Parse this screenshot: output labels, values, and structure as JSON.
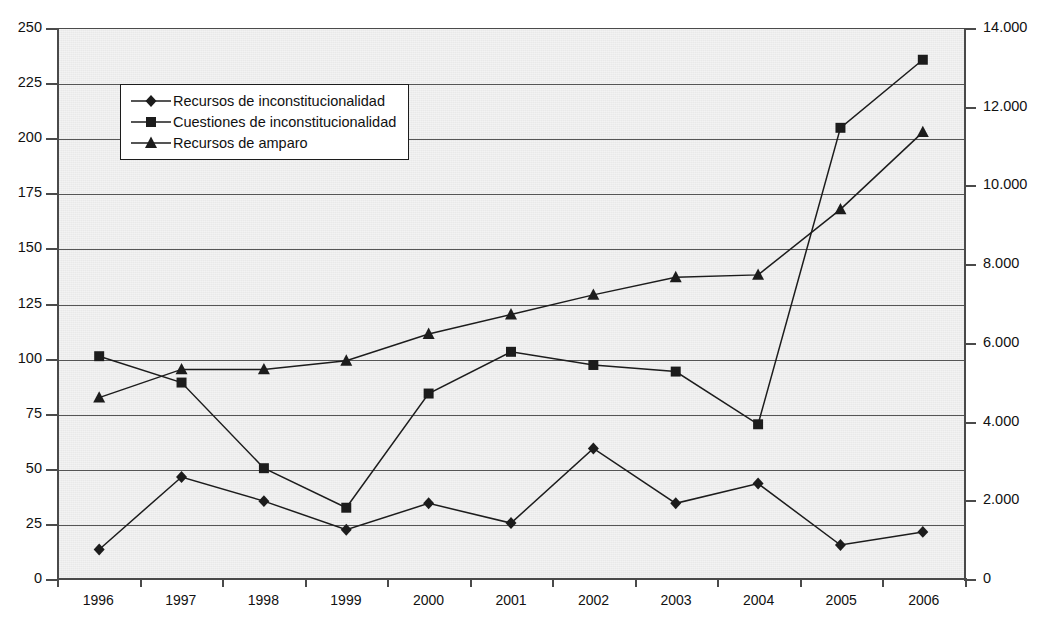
{
  "chart_title": "",
  "chart_data": {
    "type": "line",
    "title": "",
    "xlabel": "",
    "ylabel": "",
    "grid": true,
    "legend_position": "upper-left-inside",
    "categories": [
      "1996",
      "1997",
      "1998",
      "1999",
      "2000",
      "2001",
      "2002",
      "2003",
      "2004",
      "2005",
      "2006"
    ],
    "axes": {
      "left": {
        "label": "",
        "ylim": [
          0,
          250
        ],
        "tick_step": 25,
        "ticks": [
          "0",
          "25",
          "50",
          "75",
          "100",
          "125",
          "150",
          "175",
          "200",
          "225",
          "250"
        ]
      },
      "right": {
        "label": "",
        "ylim": [
          0,
          14000
        ],
        "tick_step": 2000,
        "ticks": [
          "0",
          "2.000",
          "4.000",
          "6.000",
          "8.000",
          "10.000",
          "12.000",
          "14.000"
        ]
      }
    },
    "series": [
      {
        "name": "Recursos de inconstitucionalidad",
        "axis": "left",
        "marker": "diamond",
        "values": [
          13,
          46,
          35,
          22,
          34,
          25,
          59,
          34,
          43,
          15,
          21
        ]
      },
      {
        "name": "Cuestiones de inconstitucionalidad",
        "axis": "left",
        "marker": "square",
        "values": [
          101,
          89,
          50,
          32,
          84,
          103,
          97,
          94,
          70,
          205,
          236
        ]
      },
      {
        "name": "Recursos de amparo",
        "axis": "right",
        "marker": "triangle",
        "values": [
          4600,
          5320,
          5320,
          5540,
          6220,
          6720,
          7220,
          7670,
          7730,
          9400,
          11370
        ]
      }
    ]
  },
  "legend": {
    "items": [
      {
        "label": "Recursos de inconstitucionalidad",
        "marker": "diamond"
      },
      {
        "label": "Cuestiones de inconstitucionalidad",
        "marker": "square"
      },
      {
        "label": "Recursos de amparo",
        "marker": "triangle"
      }
    ]
  },
  "colors": {
    "plot_background": "#e9e9e9",
    "line": "#1c1c1c",
    "grid": "#555555",
    "axis": "#4a4a4a",
    "text": "#111111"
  }
}
